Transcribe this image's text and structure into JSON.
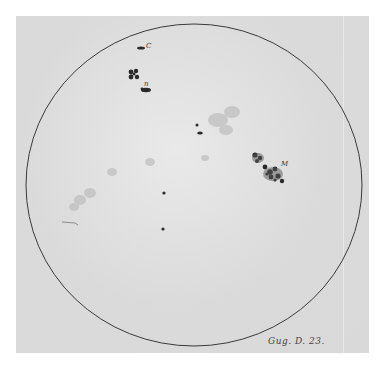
{
  "image": {
    "subject": "Hand-drawn sunspot observation disc",
    "caption": "Gug. D. 23.",
    "labels": {
      "c": "C",
      "b": "n",
      "m": "M"
    },
    "colors": {
      "paper": "#d9d9d9",
      "ink": "#3a3a3a",
      "faculae": "#b8b8b8",
      "background": "#ffffff"
    }
  }
}
